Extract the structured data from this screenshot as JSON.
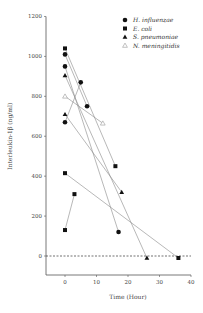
{
  "chart_data": {
    "type": "line",
    "title": "",
    "xlabel": "Time (Hour)",
    "ylabel": "Interleukin-1β (ng/ml)",
    "xlim": [
      -6,
      40
    ],
    "ylim": [
      -100,
      1200
    ],
    "xticks": [
      0,
      10,
      20,
      30,
      40
    ],
    "yticks": [
      0,
      200,
      400,
      600,
      800,
      1000,
      1200
    ],
    "grid": false,
    "reference_line": {
      "y": 0,
      "style": "dashed"
    },
    "legend_position": "upper right",
    "series": [
      {
        "name": "H. influenzae",
        "marker": "filled-circle",
        "pairs": [
          [
            [
              0,
              1010
            ],
            [
              7,
              750
            ]
          ],
          [
            [
              0,
              950
            ],
            [
              17,
              120
            ]
          ],
          [
            [
              0,
              670
            ],
            [
              5,
              870
            ]
          ]
        ]
      },
      {
        "name": "E. coli",
        "marker": "filled-square",
        "pairs": [
          [
            [
              0,
              1040
            ],
            [
              16,
              450
            ]
          ],
          [
            [
              0,
              415
            ],
            [
              36,
              -10
            ]
          ],
          [
            [
              0,
              130
            ],
            [
              3,
              310
            ]
          ]
        ]
      },
      {
        "name": "S. pneumoniae",
        "marker": "filled-triangle",
        "pairs": [
          [
            [
              0,
              905
            ],
            [
              26,
              -10
            ]
          ],
          [
            [
              0,
              710
            ],
            [
              18,
              320
            ]
          ]
        ]
      },
      {
        "name": "N. meningitidis",
        "marker": "open-triangle",
        "pairs": [
          [
            [
              0,
              800
            ],
            [
              12,
              665
            ]
          ]
        ]
      }
    ]
  },
  "labels": {
    "xlabel": "Time (Hour)",
    "ylabel": "Interleukin-1β (ng/ml)",
    "legend": [
      "H. influenzae",
      "E. coli",
      "S. pneumoniae",
      "N. meningitidis"
    ],
    "xticks": [
      "0",
      "10",
      "20",
      "30",
      "40"
    ],
    "yticks": [
      "0",
      "200",
      "400",
      "600",
      "800",
      "1000",
      "1200"
    ]
  }
}
